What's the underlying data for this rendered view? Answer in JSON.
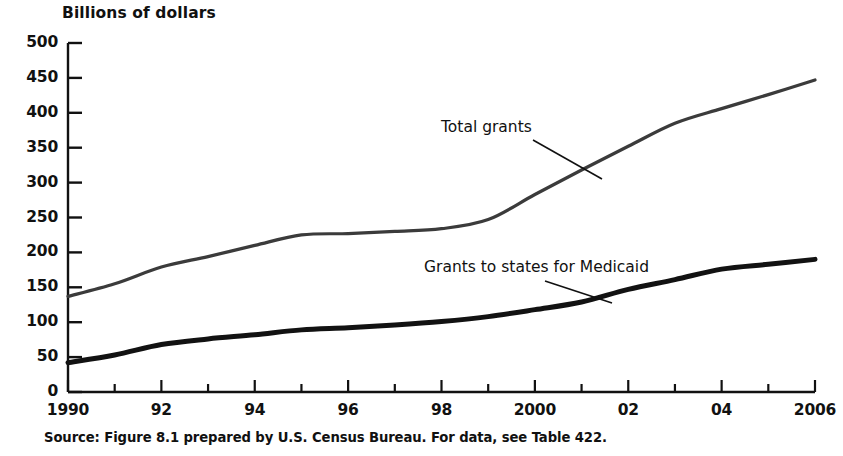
{
  "figure": {
    "axis_title": "Billions of dollars",
    "source_note": "Source: Figure 8.1 prepared by U.S. Census Bureau.  For data, see Table 422."
  },
  "chart_data": {
    "type": "line",
    "title": "Billions of dollars",
    "xlabel": "",
    "ylabel": "Billions of dollars",
    "xlim": [
      1990,
      2006
    ],
    "ylim": [
      0,
      500
    ],
    "grid": false,
    "legend": "annotations-on-plot",
    "x": [
      1990,
      1991,
      1992,
      1993,
      1994,
      1995,
      1996,
      1997,
      1998,
      1999,
      2000,
      2001,
      2002,
      2003,
      2004,
      2005,
      2006
    ],
    "xtick_values": [
      1990,
      1992,
      1994,
      1996,
      1998,
      2000,
      2002,
      2004,
      2006
    ],
    "xtick_labels": [
      "1990",
      "92",
      "94",
      "96",
      "98",
      "2000",
      "02",
      "04",
      "2006"
    ],
    "ytick_values": [
      0,
      50,
      100,
      150,
      200,
      250,
      300,
      350,
      400,
      450,
      500
    ],
    "ytick_labels": [
      "0",
      "50",
      "100",
      "150",
      "200",
      "250",
      "300",
      "350",
      "400",
      "450",
      "500"
    ],
    "series": [
      {
        "name": "Total grants",
        "label_text": "Total grants",
        "color": "#3b3b3b",
        "line_width": 3.2,
        "values": [
          137,
          155,
          179,
          194,
          210,
          225,
          227,
          230,
          234,
          247,
          283,
          318,
          352,
          385,
          406,
          426,
          447
        ]
      },
      {
        "name": "Grants to states for Medicaid",
        "label_text": "Grants to states for Medicaid",
        "color": "#121212",
        "line_width": 5.0,
        "values": [
          42,
          53,
          68,
          76,
          82,
          89,
          92,
          96,
          101,
          108,
          118,
          129,
          147,
          161,
          176,
          183,
          190
        ]
      }
    ]
  },
  "colors": {
    "axis": "#111111",
    "background": "#ffffff",
    "total_grants": "#3b3b3b",
    "medicaid": "#121212"
  }
}
